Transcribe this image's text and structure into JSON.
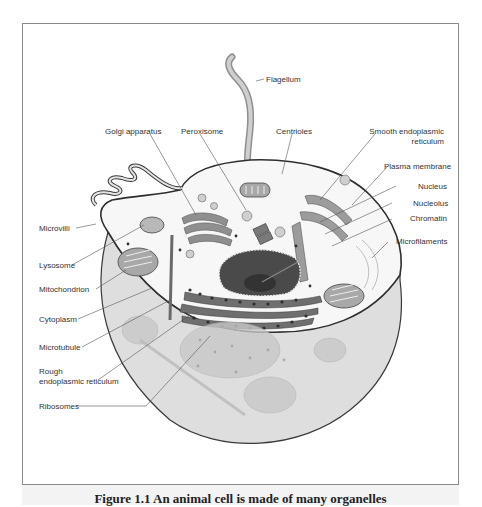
{
  "figure": {
    "type": "Animal cell diagram",
    "caption_partial": "Figure 1.1 An animal cell is made of many organelles",
    "labels": {
      "flagellum": "Flagellum",
      "golgi": "Golgi apparatus",
      "peroxisome": "Peroxisome",
      "centrioles": "Centrioles",
      "smooth_er_1": "Smooth endoplasmic",
      "smooth_er_2": "reticulum",
      "plasma_membrane": "Plasma membrane",
      "nucleus": "Nucleus",
      "nucleolus": "Nucleolus",
      "chromatin": "Chromatin",
      "microfilaments": "Microfilaments",
      "microvilli": "Microvilli",
      "lysosome": "Lysosome",
      "mitochondrion": "Mitochondrion",
      "cytoplasm": "Cytoplasm",
      "microtubule": "Microtubule",
      "rough_er_1": "Rough",
      "rough_er_2": "endoplasmic reticulum",
      "ribosomes": "Ribosomes"
    },
    "colors": {
      "frame": "#8a8a8a",
      "membrane": "#3a3a3a",
      "cytoplasm_fill": "#e2e2e2",
      "organelle": "#9a9a9a",
      "nucleus": "#4a4a4a",
      "leader_line": "#555555"
    }
  }
}
